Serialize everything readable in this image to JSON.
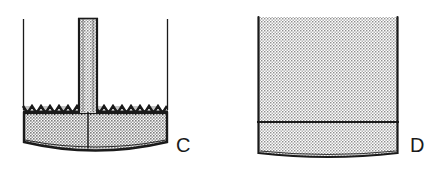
{
  "figure": {
    "caption_c": "C",
    "caption_d": "D",
    "background_color": "#ffffff",
    "ink_color": "#1a1a1a",
    "stipple_color": "#9c9c9c",
    "stipple_dark_color": "#5a5a5a",
    "panels": [
      {
        "id": "C",
        "label": "C",
        "label_x": 176,
        "label_y": 152,
        "description": "vessel with central capillary tube and zigzag interface over stippled fill",
        "vessel": {
          "left_wall_x": 23,
          "right_wall_x": 168,
          "top_y": 18,
          "bottom_y": 148,
          "bottom_curve_depth": 10,
          "wall_thickness_top": 1,
          "wall_thickness_fill": 3
        },
        "fill": {
          "top_y": 112,
          "bottom_y": 150,
          "pattern": "stipple",
          "shade": "#a8a8a8"
        },
        "interface": {
          "type": "zigzag",
          "top_y": 105,
          "bottom_y": 114,
          "tooth_width": 9,
          "tooth_count": 16,
          "color": "#1a1a1a"
        },
        "tube": {
          "left_x": 78,
          "right_x": 98,
          "top_y": 18,
          "bottom_y": 112,
          "wall_color": "#1a1a1a",
          "interior_pattern": "stipple"
        },
        "center_line": {
          "x": 88,
          "top_y": 112,
          "bottom_y": 148,
          "color": "#1a1a1a"
        }
      },
      {
        "id": "D",
        "label": "D",
        "label_x": 410,
        "label_y": 152,
        "description": "vessel uniformly filled with stipple, divided by a horizontal line near the base",
        "vessel": {
          "left_wall_x": 258,
          "right_wall_x": 398,
          "top_y": 17,
          "bottom_y": 158,
          "bottom_curve_depth": 6,
          "wall_thickness_top": 2,
          "wall_thickness_fill": 2
        },
        "fill": {
          "top_y": 17,
          "bottom_y": 160,
          "pattern": "stipple",
          "shade": "#b4b4b4"
        },
        "divider_line": {
          "y": 122,
          "left_x": 257,
          "right_x": 399,
          "color": "#1a1a1a"
        }
      }
    ]
  }
}
